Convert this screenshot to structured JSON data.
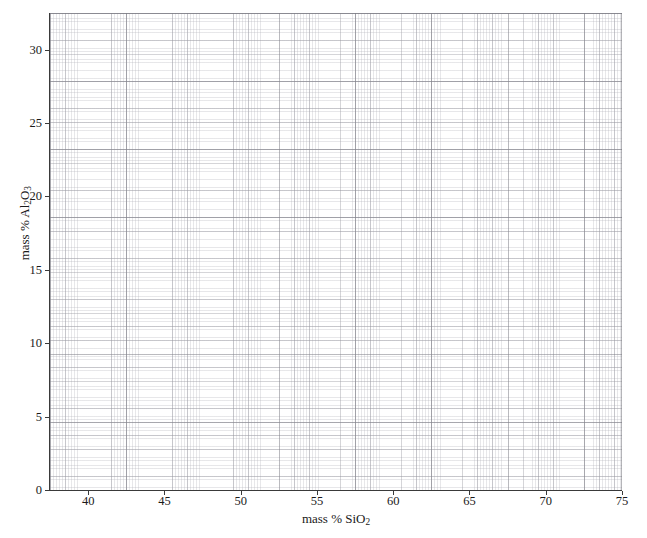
{
  "figure": {
    "background_color": "#ffffff",
    "plot_background_color": "#ffffff",
    "grid_color": "#b0b0b8",
    "axis_color": "#3a3a3a"
  },
  "chart_data": {
    "type": "scatter",
    "title": "",
    "subtitle": "",
    "xlabel": "mass % SiO2",
    "ylabel": "mass % Al2O3",
    "xlabel_parts": {
      "text": "mass % SiO",
      "sub": "2"
    },
    "ylabel_parts": {
      "text": "mass % Al",
      "sub": "2",
      "text2": "O",
      "sub2": "3"
    },
    "xlim": [
      37.5,
      75
    ],
    "ylim": [
      0,
      32.5
    ],
    "x_ticks": [
      40,
      45,
      50,
      55,
      60,
      65,
      70,
      75
    ],
    "y_ticks": [
      0,
      5,
      10,
      15,
      20,
      25,
      30
    ],
    "x_tick_labels": [
      "40",
      "45",
      "50",
      "55",
      "60",
      "65",
      "70",
      "75"
    ],
    "y_tick_labels": [
      "0",
      "5",
      "10",
      "15",
      "20",
      "25",
      "30"
    ],
    "x_minor_step": 1,
    "y_minor_step": 1,
    "x_fine_step": 0.2,
    "y_fine_step": 0.2,
    "grid": true,
    "grid_style": "graph-paper",
    "legend": false,
    "legend_position": "none",
    "series": [],
    "x": [],
    "values": [],
    "annotations": [],
    "note": "empty graph-paper plot, no data points plotted"
  }
}
